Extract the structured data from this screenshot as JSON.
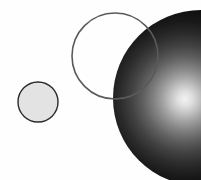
{
  "canvas": {
    "width": 201,
    "height": 180,
    "background_color": "#fefefe",
    "title": "Three overlapping circles figure"
  },
  "palette": {
    "background": "#fefefe",
    "small_circle_fill": "#e3e3e3",
    "small_circle_stroke": "#2b2b2b",
    "outline_circle_stroke": "#5a5a5a",
    "outline_circle_fill": "none",
    "sphere_highlight": "#f2f2f2",
    "sphere_mid": "#6a6a6a",
    "sphere_edge": "#0b0b0b"
  },
  "shapes": [
    {
      "id": "small-flat-circle",
      "name": "small-gray-circle",
      "kind": "circle",
      "fill_style": "flat",
      "cx": 38,
      "cy": 102,
      "r": 20,
      "fill": "#e3e3e3",
      "stroke": "#2b2b2b",
      "stroke_width": 1.4
    },
    {
      "id": "outline-circle",
      "name": "outlined-empty-circle",
      "kind": "circle",
      "fill_style": "none",
      "cx": 115,
      "cy": 56,
      "r": 43,
      "fill": "none",
      "stroke": "#5a5a5a",
      "stroke_width": 1.6
    },
    {
      "id": "shaded-sphere",
      "name": "shaded-dark-sphere",
      "kind": "circle",
      "fill_style": "radial-gradient",
      "cx": 201,
      "cy": 98,
      "r": 88,
      "highlight_cx": 185,
      "highlight_cy": 99,
      "highlight_r": 6,
      "gradient_stops": [
        {
          "offset": "0%",
          "color": "#f2f2f2"
        },
        {
          "offset": "12%",
          "color": "#cfcfcf"
        },
        {
          "offset": "28%",
          "color": "#8e8e8e"
        },
        {
          "offset": "46%",
          "color": "#525252"
        },
        {
          "offset": "66%",
          "color": "#262626"
        },
        {
          "offset": "84%",
          "color": "#0f0f0f"
        },
        {
          "offset": "100%",
          "color": "#090909"
        }
      ]
    }
  ],
  "draw_order": [
    "shaded-sphere",
    "outline-circle",
    "small-flat-circle"
  ],
  "labels": {
    "figure_caption": "",
    "axis_labels": [],
    "annotations": []
  }
}
